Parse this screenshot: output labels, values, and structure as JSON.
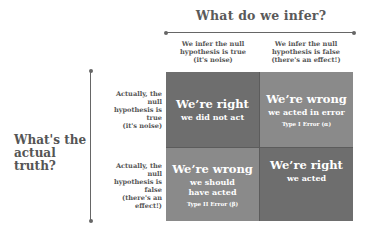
{
  "top_axis": {
    "title": "What do we infer?"
  },
  "side_axis": {
    "title": "What's the actual truth?"
  },
  "columns": [
    {
      "label": "We infer the null hypothesis is true (it's noise)",
      "lines": [
        "We infer the null",
        "hypothesis is true",
        "(it's noise)"
      ]
    },
    {
      "label": "We infer the null hypothesis is false (there's an effect!)",
      "lines": [
        "We infer the null",
        "hypothesis is false",
        "(there's an effect!)"
      ]
    }
  ],
  "rows": [
    {
      "label": "Actually, the null hypothesis is true (it's noise)",
      "lines": [
        "Actually, the null",
        "hypothesis is true",
        "(it's noise)"
      ]
    },
    {
      "label": "Actually, the null hypothesis is false (there's an effect!)",
      "lines": [
        "Actually, the null",
        "hypothesis is false",
        "(there's an effect!)"
      ]
    }
  ],
  "cells": [
    {
      "title": "We’re right",
      "subtitle": "we did not act",
      "error": "",
      "color": "#6e6e6e"
    },
    {
      "title": "We’re wrong",
      "subtitle": "we acted in error",
      "error": "Type I Error (α)",
      "color": "#8a8a8a"
    },
    {
      "title": "We’re wrong",
      "subtitle": "we should have acted",
      "error": "Type II Error (β)",
      "color": "#8a8a8a"
    },
    {
      "title": "We’re right",
      "subtitle": "we acted",
      "error": "",
      "color": "#6e6e6e"
    }
  ]
}
